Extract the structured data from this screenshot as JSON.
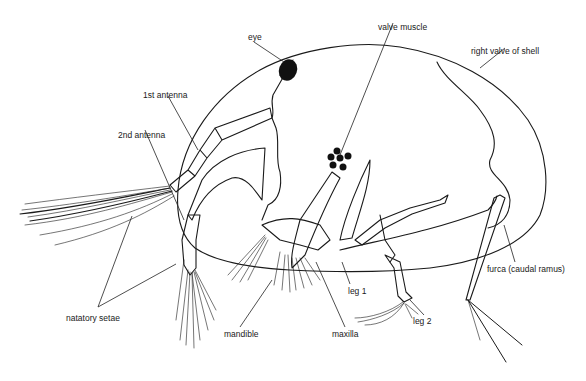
{
  "figure": {
    "labels": {
      "eye": "eye",
      "valve_muscle": "valve muscle",
      "right_valve": "right valve of shell",
      "first_antenna": "1st antenna",
      "second_antenna": "2nd antenna",
      "natatory_setae": "natatory setae",
      "mandible": "mandible",
      "maxilla": "maxilla",
      "leg1": "leg 1",
      "leg2": "leg 2",
      "furca": "furca (caudal ramus)"
    },
    "colors": {
      "ink": "#1a1a1a",
      "background": "#ffffff"
    }
  }
}
